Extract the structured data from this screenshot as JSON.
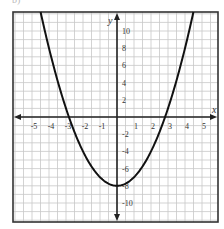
{
  "corner_label": "b)",
  "colors": {
    "grid": "#c8c8c8",
    "axis": "#222222",
    "curve": "#111111",
    "frame": "#333333",
    "text": "#333333"
  },
  "chart_data": {
    "type": "line",
    "title": "",
    "xlabel": "x",
    "ylabel": "y",
    "equation": "y = x^2 - 8",
    "xlim": [
      -6,
      6
    ],
    "ylim": [
      -12.5,
      12
    ],
    "grid": true,
    "x_grid_step": 0.5,
    "y_grid_step": 1,
    "x_ticks": [
      -5,
      -4,
      -3,
      -2,
      -1,
      1,
      2,
      3,
      4,
      5
    ],
    "y_ticks": [
      -10,
      -8,
      -6,
      -4,
      -2,
      2,
      4,
      6,
      8,
      10
    ],
    "x_tick_labels": [
      "-5",
      "-4",
      "-3",
      "-2",
      "-1",
      "1",
      "2",
      "3",
      "4",
      "5"
    ],
    "y_tick_labels": [
      "-10",
      "-8",
      "-6",
      "-4",
      "-2",
      "2",
      "4",
      "6",
      "8",
      "10"
    ],
    "series": [
      {
        "name": "parabola",
        "x": [
          -4.47,
          -4,
          -3.5,
          -3,
          -2.83,
          -2.5,
          -2,
          -1.5,
          -1,
          -0.5,
          0,
          0.5,
          1,
          1.5,
          2,
          2.5,
          2.83,
          3,
          3.5,
          4,
          4.47
        ],
        "y": [
          12,
          8,
          4.25,
          1,
          0,
          -1.75,
          -4,
          -5.75,
          -7,
          -7.75,
          -8,
          -7.75,
          -7,
          -5.75,
          -4,
          -1.75,
          0,
          1,
          4.25,
          8,
          12
        ]
      }
    ],
    "key_points": {
      "vertex": [
        0,
        -8
      ],
      "x_intercepts": [
        -2.83,
        2.83
      ],
      "y_intercept": -8
    }
  }
}
